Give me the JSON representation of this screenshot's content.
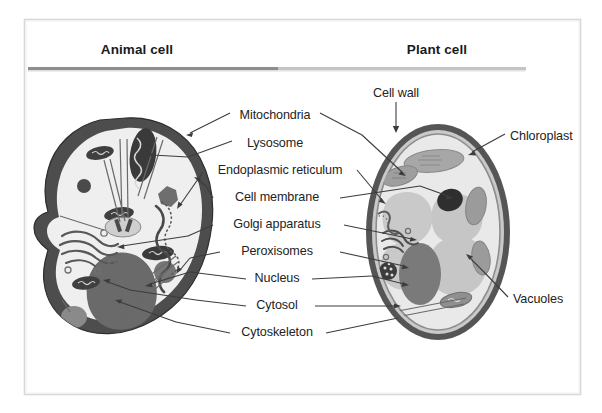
{
  "figure": {
    "title_left": "Animal cell",
    "title_right": "Plant cell",
    "frame_color": "#d8d8d8",
    "background": "#ffffff",
    "ink_color": "#232323"
  },
  "headers": [
    {
      "name": "animal-cell",
      "label": "Animal cell",
      "x": 137,
      "y": 49
    },
    {
      "name": "plant-cell",
      "label": "Plant cell",
      "x": 437,
      "y": 49
    }
  ],
  "divider": {
    "x1": 28,
    "x2": 525,
    "y": 68,
    "left_color": "#8e8e8e",
    "right_color": "#c6c6c6"
  },
  "labels": {
    "cell_wall": {
      "text": "Cell wall",
      "x": 396,
      "y": 95,
      "align": "center"
    },
    "center": [
      {
        "name": "mitochondria",
        "text": "Mitochondria",
        "x": 275,
        "y": 117
      },
      {
        "name": "lysosome",
        "text": "Lysosome",
        "x": 275,
        "y": 145
      },
      {
        "name": "endoplasmic-reticulum",
        "text": "Endoplasmic reticulum",
        "x": 280,
        "y": 172
      },
      {
        "name": "cell-membrane",
        "text": "Cell membrane",
        "x": 277,
        "y": 200
      },
      {
        "name": "golgi-apparatus",
        "text": "Golgi apparatus",
        "x": 277,
        "y": 227
      },
      {
        "name": "peroxisomes",
        "text": "Peroxisomes",
        "x": 277,
        "y": 254
      },
      {
        "name": "nucleus",
        "text": "Nucleus",
        "x": 277,
        "y": 281
      },
      {
        "name": "cytosol",
        "text": "Cytosol",
        "x": 277,
        "y": 308
      },
      {
        "name": "cytoskeleton",
        "text": "Cytoskeleton",
        "x": 277,
        "y": 335
      }
    ],
    "right": [
      {
        "name": "chloroplast",
        "text": "Chloroplast",
        "x": 510,
        "y": 138
      },
      {
        "name": "vacuoles",
        "text": "Vacuoles",
        "x": 513,
        "y": 301
      }
    ]
  },
  "palette": {
    "membrane_dark": "#4d4d4d",
    "cytoplasm": "#efefef",
    "nucleus_animal": "#6a6a6a",
    "nucleus_plant": "#7a7a7a",
    "wall_outer": "#555555",
    "wall_inner": "#d0d0d0",
    "plant_cytoplasm": "#e4e4e4",
    "vacuole": "#c9c9c9",
    "chloroplast": "#9a9a9a",
    "organelle_dark": "#3a3a3a",
    "line": "#3c3c3c"
  },
  "structures": {
    "animal_cell": [
      "cell membrane",
      "nucleus",
      "mitochondria",
      "lysosome",
      "endoplasmic reticulum",
      "golgi apparatus",
      "peroxisomes",
      "cytosol",
      "cytoskeleton"
    ],
    "plant_cell": [
      "cell wall",
      "cell membrane",
      "nucleus",
      "chloroplast",
      "vacuoles",
      "mitochondria",
      "endoplasmic reticulum",
      "golgi apparatus",
      "peroxisomes",
      "cytosol"
    ]
  }
}
